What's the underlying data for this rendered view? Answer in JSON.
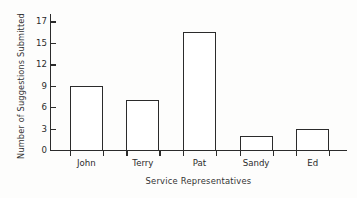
{
  "chart_data": {
    "type": "bar",
    "title": "",
    "xlabel": "Service Representatives",
    "ylabel": "Number of Suggestions Submitted",
    "categories": [
      "John",
      "Terry",
      "Pat",
      "Sandy",
      "Ed"
    ],
    "values": [
      9,
      7,
      16,
      2,
      3
    ],
    "series": [
      {
        "name": "Number of Suggestions Submitted",
        "values": [
          9,
          7,
          16,
          2,
          3
        ]
      }
    ],
    "ytick_labels": [
      "0",
      "3",
      "6",
      "9",
      "12",
      "15",
      "17"
    ],
    "ytick_values": [
      0,
      3,
      6,
      9,
      12,
      15,
      17
    ],
    "ylim": [
      0,
      17
    ],
    "xlim_categories": 5,
    "grid": false,
    "legend": "none",
    "bar_fill_color": "#ffffff",
    "bar_edge_color": "#2b2b2b",
    "axis_color": "#2b2b2b",
    "background_color": "#fdfdfc"
  }
}
